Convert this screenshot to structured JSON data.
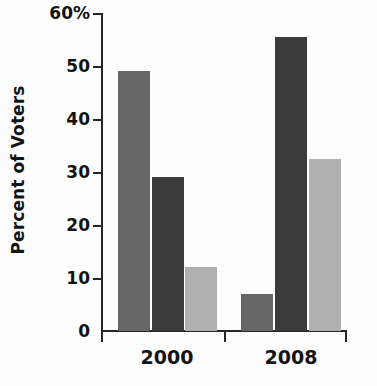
{
  "chart_data": {
    "type": "bar",
    "title": "",
    "subtitle": "",
    "xlabel": "",
    "ylabel": "Percent of Voters",
    "categories": [
      "2000",
      "2008"
    ],
    "ylim": [
      0,
      60
    ],
    "yticks": [
      0,
      10,
      20,
      30,
      40,
      50,
      60
    ],
    "ytick_labels": [
      "0",
      "10",
      "20",
      "30",
      "40",
      "50",
      "60%"
    ],
    "grid": false,
    "legend": "none",
    "series": [
      {
        "name": "series-1",
        "color": "#666666",
        "values": [
          49,
          7
        ]
      },
      {
        "name": "series-2",
        "color": "#3b3b3b",
        "values": [
          29,
          55.5
        ]
      },
      {
        "name": "series-3",
        "color": "#b0b0b0",
        "values": [
          12,
          32.5
        ]
      }
    ],
    "bars": [
      {
        "group": "2000",
        "series": "series-1",
        "value": 49,
        "color": "#666666"
      },
      {
        "group": "2000",
        "series": "series-2",
        "value": 29,
        "color": "#3b3b3b"
      },
      {
        "group": "2000",
        "series": "series-3",
        "value": 12,
        "color": "#b0b0b0"
      },
      {
        "group": "2008",
        "series": "series-1",
        "value": 7,
        "color": "#666666"
      },
      {
        "group": "2008",
        "series": "series-2",
        "value": 55.5,
        "color": "#3b3b3b"
      },
      {
        "group": "2008",
        "series": "series-3",
        "value": 32.5,
        "color": "#b0b0b0"
      }
    ]
  },
  "axis": {
    "y_title": "Percent of Voters",
    "y_labels": {
      "t60": "60%",
      "t50": "50",
      "t40": "40",
      "t30": "30",
      "t20": "20",
      "t10": "10",
      "t0": "0"
    },
    "x_labels": {
      "g0": "2000",
      "g1": "2008"
    }
  },
  "colors": {
    "axis": "#262626",
    "text": "#141414",
    "background": "#fdfdfd",
    "bar_medium": "#666666",
    "bar_dark": "#3b3b3b",
    "bar_light": "#b0b0b0"
  }
}
